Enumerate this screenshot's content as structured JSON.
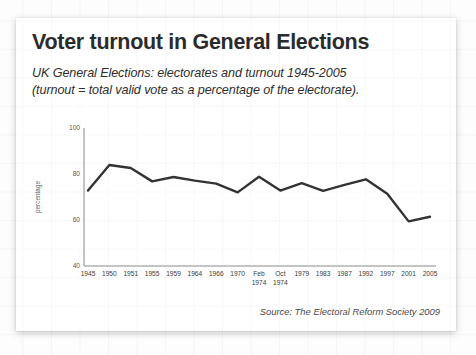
{
  "slide": {
    "title": "Voter turnout in General Elections",
    "subtitle_line1": "UK General Elections: electorates and turnout 1945-2005",
    "subtitle_line2": "(turnout = total valid vote as a percentage of the electorate).",
    "source": "Source: The Electoral Reform Society 2009"
  },
  "chart_data": {
    "type": "line",
    "title": "Voter turnout in General Elections",
    "xlabel": "",
    "ylabel": "percentage",
    "ylim": [
      40,
      100
    ],
    "yticks": [
      40,
      60,
      80,
      100
    ],
    "grid": false,
    "legend": "none",
    "categories": [
      "1945",
      "1950",
      "1951",
      "1955",
      "1959",
      "1964",
      "1966",
      "1970",
      "Feb 1974",
      "Oct 1974",
      "1979",
      "1983",
      "1987",
      "1992",
      "1997",
      "2001",
      "2005"
    ],
    "category_lines": [
      [
        "1945"
      ],
      [
        "1950"
      ],
      [
        "1951"
      ],
      [
        "1955"
      ],
      [
        "1959"
      ],
      [
        "1964"
      ],
      [
        "1966"
      ],
      [
        "1970"
      ],
      [
        "Feb",
        "1974"
      ],
      [
        "Oct",
        "1974"
      ],
      [
        "1979"
      ],
      [
        "1983"
      ],
      [
        "1987"
      ],
      [
        "1992"
      ],
      [
        "1997"
      ],
      [
        "2001"
      ],
      [
        "2005"
      ]
    ],
    "series": [
      {
        "name": "Turnout",
        "color": "#333333",
        "values": [
          72.8,
          83.9,
          82.6,
          76.8,
          78.7,
          77.1,
          75.8,
          72.0,
          78.8,
          72.8,
          76.0,
          72.7,
          75.3,
          77.7,
          71.4,
          59.4,
          61.4
        ]
      }
    ]
  }
}
